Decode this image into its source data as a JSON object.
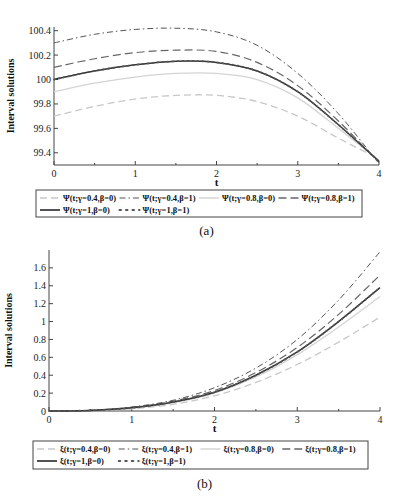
{
  "chart_data": [
    {
      "type": "line",
      "panel": "a",
      "caption": "(a)",
      "xlabel": "t",
      "ylabel": "Interval solutions",
      "xlim": [
        0,
        4
      ],
      "ylim": [
        99.3,
        100.43
      ],
      "xticks": [
        "0",
        "1",
        "2",
        "3",
        "4"
      ],
      "yticks": [
        "99.4",
        "99.6",
        "99.8",
        "100",
        "100.2",
        "100.4"
      ],
      "x": [
        0,
        0.5,
        1,
        1.5,
        2,
        2.5,
        3,
        3.5,
        4
      ],
      "series": [
        {
          "name": "Ψ(t;γ=0.4,β=0)",
          "style": "light-dash",
          "values": [
            99.7,
            99.78,
            99.84,
            99.87,
            99.87,
            99.82,
            99.7,
            99.52,
            99.35
          ]
        },
        {
          "name": "Ψ(t;γ=0.4,β=1)",
          "style": "dash-dot",
          "values": [
            100.3,
            100.37,
            100.41,
            100.42,
            100.39,
            100.28,
            100.05,
            99.72,
            99.31
          ]
        },
        {
          "name": "Ψ(t;γ=0.8,β=0)",
          "style": "light-solid",
          "values": [
            99.9,
            99.97,
            100.02,
            100.05,
            100.05,
            100.0,
            99.85,
            99.6,
            99.34
          ]
        },
        {
          "name": "Ψ(t;γ=0.8,β=1)",
          "style": "dash",
          "values": [
            100.1,
            100.17,
            100.22,
            100.24,
            100.23,
            100.14,
            99.95,
            99.66,
            99.32
          ]
        },
        {
          "name": "Ψ(t;γ=1,β=0)",
          "style": "solid",
          "values": [
            100.0,
            100.07,
            100.12,
            100.15,
            100.14,
            100.07,
            99.9,
            99.63,
            99.33
          ]
        },
        {
          "name": "Ψ(t;γ=1,β=1)",
          "style": "dots",
          "values": [
            100.0,
            100.07,
            100.12,
            100.15,
            100.14,
            100.07,
            99.9,
            99.63,
            99.33
          ]
        }
      ],
      "legend_position": "below"
    },
    {
      "type": "line",
      "panel": "b",
      "caption": "(b)",
      "xlabel": "t",
      "ylabel": "Interval solutions",
      "xlim": [
        0,
        4
      ],
      "ylim": [
        0,
        1.8
      ],
      "xticks": [
        "0",
        "1",
        "2",
        "3",
        "4"
      ],
      "yticks": [
        "0",
        "0.2",
        "0.4",
        "0.6",
        "0.8",
        "1",
        "1.2",
        "1.4",
        "1.6"
      ],
      "x": [
        0,
        0.5,
        1,
        1.5,
        2,
        2.5,
        3,
        3.5,
        4
      ],
      "series": [
        {
          "name": "ξ(t;γ=0.4,β=0)",
          "style": "light-dash",
          "values": [
            0,
            0.004,
            0.025,
            0.075,
            0.17,
            0.32,
            0.52,
            0.77,
            1.05
          ]
        },
        {
          "name": "ξ(t;γ=0.4,β=1)",
          "style": "dash-dot",
          "values": [
            0,
            0.008,
            0.045,
            0.12,
            0.26,
            0.48,
            0.8,
            1.24,
            1.78
          ]
        },
        {
          "name": "ξ(t;γ=0.8,β=0)",
          "style": "light-solid",
          "values": [
            0,
            0.005,
            0.03,
            0.09,
            0.2,
            0.38,
            0.63,
            0.94,
            1.28
          ]
        },
        {
          "name": "ξ(t;γ=0.8,β=1)",
          "style": "dash",
          "values": [
            0,
            0.007,
            0.04,
            0.11,
            0.23,
            0.43,
            0.71,
            1.08,
            1.52
          ]
        },
        {
          "name": "ξ(t;γ=1,β=0)",
          "style": "solid",
          "values": [
            0,
            0.006,
            0.035,
            0.1,
            0.21,
            0.4,
            0.66,
            1.0,
            1.38
          ]
        },
        {
          "name": "ξ(t;γ=1,β=1)",
          "style": "dots",
          "values": [
            0,
            0.006,
            0.035,
            0.1,
            0.21,
            0.4,
            0.66,
            1.0,
            1.38
          ]
        }
      ],
      "legend_position": "below"
    }
  ]
}
